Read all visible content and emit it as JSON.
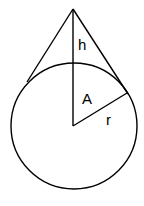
{
  "diagram": {
    "type": "geometry",
    "labels": {
      "h": "h",
      "A": "A",
      "r": "r"
    },
    "colors": {
      "stroke": "#000000",
      "background": "#ffffff"
    }
  }
}
